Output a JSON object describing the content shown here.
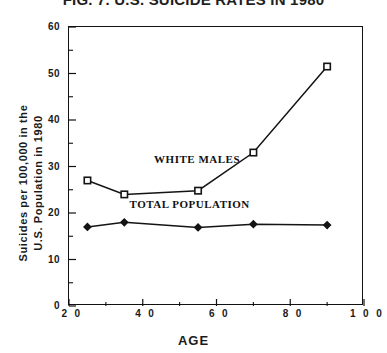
{
  "chart_data": {
    "type": "line",
    "title": "FIG. 7. U.S. SUICIDE RATES IN 1980",
    "xlabel": "AGE",
    "ylabel_line1": "Suicides per 100,000 in the",
    "ylabel_line2": "U.S. Population in 1980",
    "xlim": [
      20,
      100
    ],
    "ylim": [
      0,
      60
    ],
    "xticks": [
      20,
      40,
      60,
      80,
      100
    ],
    "xtick_labels": [
      "2 0",
      "4 0",
      "6 0",
      "8 0",
      "1 0 0"
    ],
    "yticks": [
      0,
      10,
      20,
      30,
      40,
      50,
      60
    ],
    "ytick_labels": [
      "0",
      "10",
      "20",
      "30",
      "40",
      "50",
      "60"
    ],
    "x_minor_ticks": [
      30,
      50,
      70,
      90
    ],
    "y_minor_ticks": [
      5,
      15,
      25,
      35,
      45,
      55
    ],
    "grid": false,
    "legend_position": "inline-annotations",
    "line_color": "#141414",
    "series": [
      {
        "name": "WHITE MALES",
        "marker": "open-square",
        "x": [
          25,
          35,
          55,
          70,
          90
        ],
        "values": [
          27,
          24,
          24.8,
          33,
          51.5
        ],
        "label_x": 55,
        "label_y": 31.5
      },
      {
        "name": "TOTAL POPULATION",
        "marker": "filled-diamond",
        "x": [
          25,
          35,
          55,
          70,
          90
        ],
        "values": [
          17,
          18,
          16.9,
          17.6,
          17.4
        ],
        "label_x": 53,
        "label_y": 21.8
      }
    ]
  }
}
